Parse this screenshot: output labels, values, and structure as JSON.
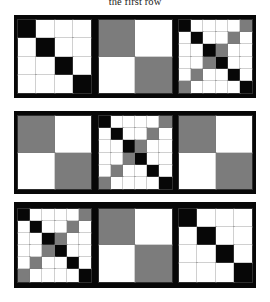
{
  "caption": {
    "text": "the first row"
  },
  "colors": {
    "background": "#ffffff",
    "panel_background": "#070707",
    "cell_white": "#ffffff",
    "cell_black": "#070707",
    "cell_gray": "#7c7c7c"
  },
  "figure": {
    "type": "matrix-grid-figure",
    "row_count": 3,
    "panels_per_row": 3,
    "rows": [
      {
        "name": "row-1",
        "panels": [
          {
            "name": "panel-1-1",
            "size": 4,
            "cells": [
              [
                "k",
                "w",
                "w",
                "w"
              ],
              [
                "w",
                "k",
                "w",
                "w"
              ],
              [
                "w",
                "w",
                "k",
                "w"
              ],
              [
                "w",
                "w",
                "w",
                "k"
              ]
            ]
          },
          {
            "name": "panel-1-2",
            "size": 2,
            "cells": [
              [
                "g",
                "w"
              ],
              [
                "w",
                "g"
              ]
            ]
          },
          {
            "name": "panel-1-3",
            "size": 6,
            "cells": [
              [
                "k",
                "w",
                "w",
                "w",
                "w",
                "g"
              ],
              [
                "w",
                "k",
                "w",
                "w",
                "g",
                "w"
              ],
              [
                "w",
                "w",
                "k",
                "g",
                "w",
                "w"
              ],
              [
                "w",
                "w",
                "g",
                "k",
                "w",
                "w"
              ],
              [
                "w",
                "g",
                "w",
                "w",
                "k",
                "w"
              ],
              [
                "g",
                "w",
                "w",
                "w",
                "w",
                "k"
              ]
            ]
          }
        ]
      },
      {
        "name": "row-2",
        "panels": [
          {
            "name": "panel-2-1",
            "size": 2,
            "cells": [
              [
                "g",
                "w"
              ],
              [
                "w",
                "g"
              ]
            ]
          },
          {
            "name": "panel-2-2",
            "size": 6,
            "cells": [
              [
                "k",
                "w",
                "w",
                "w",
                "w",
                "g"
              ],
              [
                "w",
                "k",
                "w",
                "w",
                "g",
                "w"
              ],
              [
                "w",
                "w",
                "k",
                "g",
                "w",
                "w"
              ],
              [
                "w",
                "w",
                "g",
                "k",
                "w",
                "w"
              ],
              [
                "w",
                "g",
                "w",
                "w",
                "k",
                "w"
              ],
              [
                "g",
                "w",
                "w",
                "w",
                "w",
                "k"
              ]
            ]
          },
          {
            "name": "panel-2-3",
            "size": 2,
            "cells": [
              [
                "g",
                "w"
              ],
              [
                "w",
                "g"
              ]
            ]
          }
        ]
      },
      {
        "name": "row-3",
        "panels": [
          {
            "name": "panel-3-1",
            "size": 6,
            "cells": [
              [
                "k",
                "w",
                "w",
                "w",
                "w",
                "g"
              ],
              [
                "w",
                "k",
                "w",
                "w",
                "g",
                "w"
              ],
              [
                "w",
                "w",
                "k",
                "g",
                "w",
                "w"
              ],
              [
                "w",
                "w",
                "g",
                "k",
                "w",
                "w"
              ],
              [
                "w",
                "g",
                "w",
                "w",
                "k",
                "w"
              ],
              [
                "g",
                "w",
                "w",
                "w",
                "w",
                "k"
              ]
            ]
          },
          {
            "name": "panel-3-2",
            "size": 2,
            "cells": [
              [
                "g",
                "w"
              ],
              [
                "w",
                "g"
              ]
            ]
          },
          {
            "name": "panel-3-3",
            "size": 4,
            "cells": [
              [
                "k",
                "w",
                "w",
                "w"
              ],
              [
                "w",
                "k",
                "w",
                "w"
              ],
              [
                "w",
                "w",
                "k",
                "w"
              ],
              [
                "w",
                "w",
                "w",
                "k"
              ]
            ]
          }
        ]
      }
    ]
  }
}
